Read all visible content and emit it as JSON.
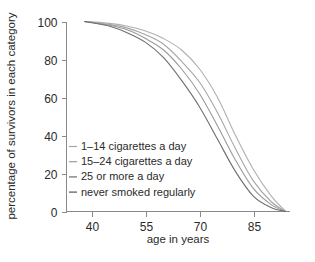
{
  "chart_data": {
    "type": "line",
    "title": "",
    "xlabel": "age in years",
    "ylabel": "percentage of survivors in each category",
    "xlim": [
      33,
      95
    ],
    "ylim": [
      0,
      100
    ],
    "grid": false,
    "legend_position": "inside-left-lower",
    "x_ticks": [
      40,
      55,
      70,
      85
    ],
    "x_tick_labels": [
      "40",
      "55",
      "70",
      "85"
    ],
    "y_ticks": [
      0,
      20,
      40,
      60,
      80,
      100
    ],
    "y_tick_labels": [
      "0",
      "20",
      "40",
      "60",
      "80",
      "100"
    ],
    "x": [
      38,
      40,
      45,
      50,
      55,
      60,
      65,
      70,
      75,
      80,
      85,
      90,
      94
    ],
    "series": [
      {
        "name": "never smoked regularly",
        "color": "#b0b0b0",
        "values": [
          100,
          99.8,
          99,
          97.5,
          95,
          91,
          85,
          75,
          60,
          40,
          22,
          8,
          0
        ]
      },
      {
        "name": "1-14 cigarettes a day",
        "color": "#a6a6a6",
        "values": [
          100,
          99.6,
          98.5,
          96.5,
          93,
          88,
          79,
          68,
          52,
          33,
          16,
          5,
          0
        ]
      },
      {
        "name": "15-24 cigarettes a day",
        "color": "#9a9a9a",
        "values": [
          100,
          99.5,
          98,
          95.5,
          91,
          85,
          75,
          62,
          45,
          27,
          12,
          3.5,
          0
        ]
      },
      {
        "name": "25 or more a day",
        "color": "#6e6e6e",
        "values": [
          100,
          99.3,
          97.5,
          94,
          89,
          81,
          69,
          55,
          38,
          21,
          8,
          2,
          0
        ]
      }
    ]
  },
  "axes": {
    "x_label": "age in years",
    "y_label": "percentage of survivors in each category"
  },
  "legend": {
    "items": [
      {
        "label": "1–14 cigarettes a day",
        "color": "#a6a6a6"
      },
      {
        "label": "15–24 cigarettes a day",
        "color": "#9a9a9a"
      },
      {
        "label": "25 or more a day",
        "color": "#6e6e6e"
      },
      {
        "label": "never smoked regularly",
        "color": "#555555"
      }
    ]
  },
  "colors": {
    "background": "#ffffff",
    "axis": "#8a8a8a",
    "text": "#2b2b2b"
  }
}
